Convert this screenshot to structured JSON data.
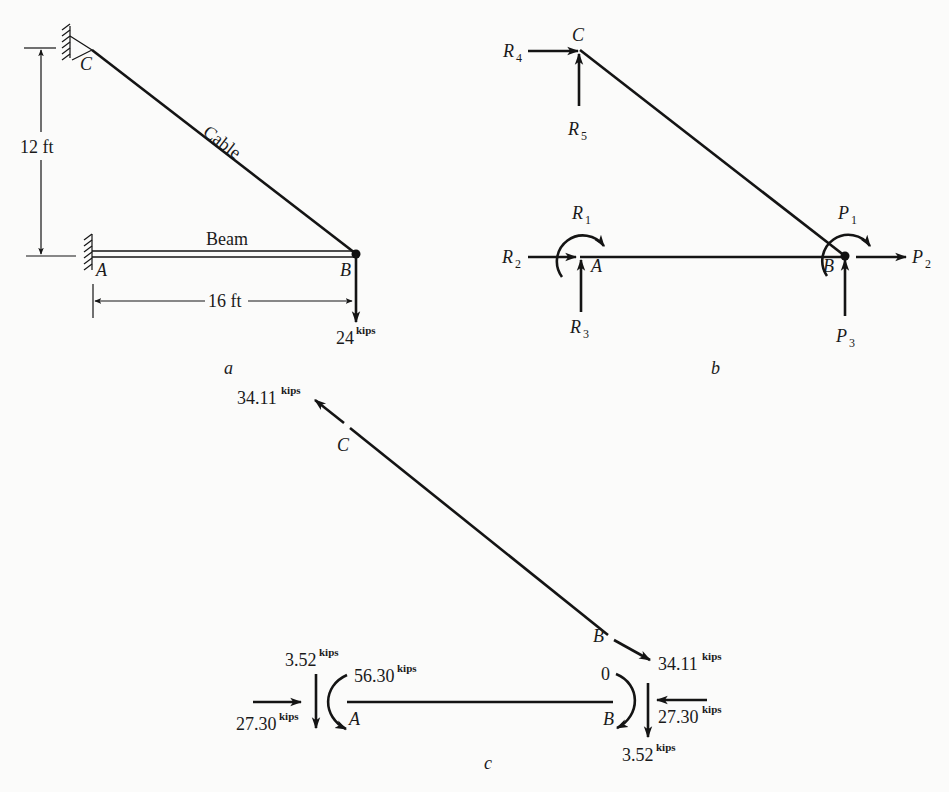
{
  "figure_a": {
    "caption": "a",
    "point_c": "C",
    "point_a": "A",
    "point_b": "B",
    "cable_label": "Cable",
    "beam_label": "Beam",
    "height_dim": "12 ft",
    "length_dim": "16 ft",
    "load_value": "24",
    "load_unit": "kips"
  },
  "figure_b": {
    "caption": "b",
    "point_c": "C",
    "point_a": "A",
    "point_b": "B",
    "forces": {
      "R1": {
        "sym": "R",
        "sub": "1"
      },
      "R2": {
        "sym": "R",
        "sub": "2"
      },
      "R3": {
        "sym": "R",
        "sub": "3"
      },
      "R4": {
        "sym": "R",
        "sub": "4"
      },
      "R5": {
        "sym": "R",
        "sub": "5"
      },
      "P1": {
        "sym": "P",
        "sub": "1"
      },
      "P2": {
        "sym": "P",
        "sub": "2"
      },
      "P3": {
        "sym": "P",
        "sub": "3"
      }
    }
  },
  "figure_c": {
    "caption": "c",
    "point_c": "C",
    "point_a": "A",
    "point_b": "B",
    "unit": "kips",
    "cable_force_c": "34.11",
    "cable_force_b": "34.11",
    "shear_a": "3.52",
    "moment_a": "56.30",
    "axial_a": "27.30",
    "moment_b": "0",
    "axial_b": "27.30",
    "shear_b": "3.52"
  }
}
